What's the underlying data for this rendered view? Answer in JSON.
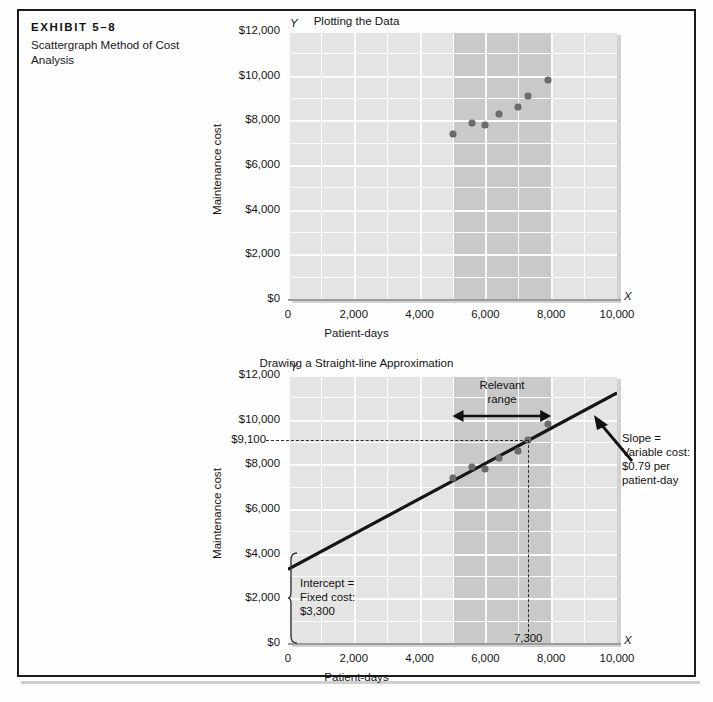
{
  "exhibit": {
    "number": "EXHIBIT 5–8",
    "caption": "Scattergraph Method of Cost Analysis"
  },
  "chart_data": [
    {
      "type": "scatter",
      "title": "Plotting the Data",
      "xlabel": "Patient-days",
      "ylabel": "Maintenance cost",
      "x_axis_letter": "X",
      "y_axis_letter": "Y",
      "xlim": [
        0,
        10000
      ],
      "ylim": [
        0,
        12000
      ],
      "xticks": [
        "0",
        "2,000",
        "4,000",
        "6,000",
        "8,000",
        "10,000"
      ],
      "xtick_values": [
        0,
        2000,
        4000,
        6000,
        8000,
        10000
      ],
      "yticks": [
        "$0",
        "$2,000",
        "$4,000",
        "$6,000",
        "$8,000",
        "$10,000",
        "$12,000"
      ],
      "ytick_values": [
        0,
        2000,
        4000,
        6000,
        8000,
        10000,
        12000
      ],
      "grid": true,
      "shaded_band": [
        5000,
        8000
      ],
      "points": [
        {
          "x": 5000,
          "y": 7400
        },
        {
          "x": 5600,
          "y": 7900
        },
        {
          "x": 6000,
          "y": 7800
        },
        {
          "x": 6400,
          "y": 8300
        },
        {
          "x": 7000,
          "y": 8600
        },
        {
          "x": 7300,
          "y": 9100
        },
        {
          "x": 7900,
          "y": 9800
        }
      ]
    },
    {
      "type": "scatter",
      "title": "Drawing a Straight-line Approximation",
      "xlabel": "Patient-days",
      "ylabel": "Maintenance cost",
      "x_axis_letter": "X",
      "y_axis_letter": "Y",
      "xlim": [
        0,
        10000
      ],
      "ylim": [
        0,
        12000
      ],
      "xticks": [
        "0",
        "2,000",
        "4,000",
        "6,000",
        "8,000",
        "10,000"
      ],
      "xtick_values": [
        0,
        2000,
        4000,
        6000,
        8000,
        10000
      ],
      "yticks": [
        "$0",
        "$2,000",
        "$4,000",
        "$6,000",
        "$8,000",
        "$10,000",
        "$12,000"
      ],
      "ytick_values": [
        0,
        2000,
        4000,
        6000,
        8000,
        10000,
        12000
      ],
      "grid": true,
      "shaded_band": [
        5000,
        8000
      ],
      "points": [
        {
          "x": 5000,
          "y": 7400
        },
        {
          "x": 5600,
          "y": 7900
        },
        {
          "x": 6000,
          "y": 7800
        },
        {
          "x": 6400,
          "y": 8300
        },
        {
          "x": 7000,
          "y": 8600
        },
        {
          "x": 7300,
          "y": 9100
        },
        {
          "x": 7900,
          "y": 9800
        }
      ],
      "trend_line": {
        "intercept": 3300,
        "slope": 0.79,
        "x_start": 0,
        "x_end": 10000
      },
      "reference_point": {
        "x": 7300,
        "y": 9100
      },
      "extra_ytick": "$9,100",
      "extra_xtick": "7,300",
      "annotations": {
        "relevant_range": "Relevant\nrange",
        "slope_note": "Slope =\nVariable cost:\n$0.79 per\npatient-day",
        "intercept_note": "Intercept =\nFixed cost:\n$3,300"
      }
    }
  ],
  "colors": {
    "plot_background": "#e4e4e4",
    "band": "#c9c9c9",
    "gridline": "#fbfbfb",
    "point": "#6d6d6d",
    "line": "#151515",
    "frame": "#1a1a1a"
  }
}
